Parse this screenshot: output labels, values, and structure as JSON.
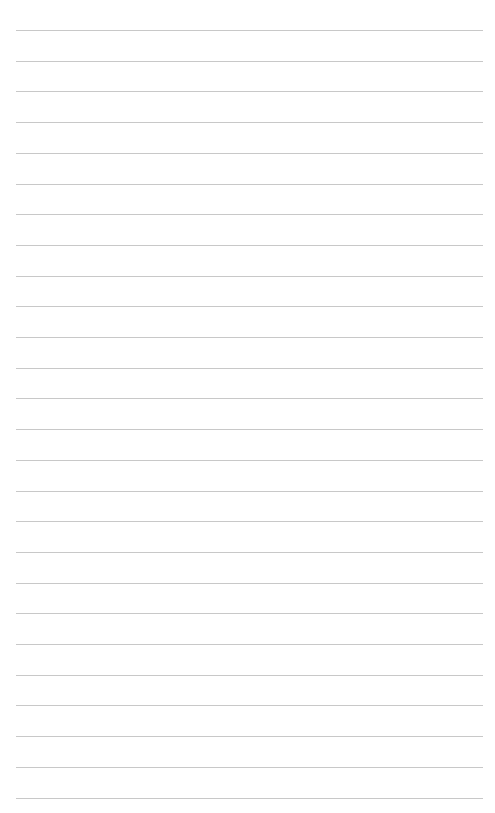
{
  "page": {
    "type": "lined-paper",
    "background_color": "#ffffff",
    "line_color": "#c8c8c8",
    "line_count": 26,
    "first_line_y": 30,
    "line_spacing": 30.7,
    "line_left": 16,
    "line_width": 467,
    "text": ""
  }
}
